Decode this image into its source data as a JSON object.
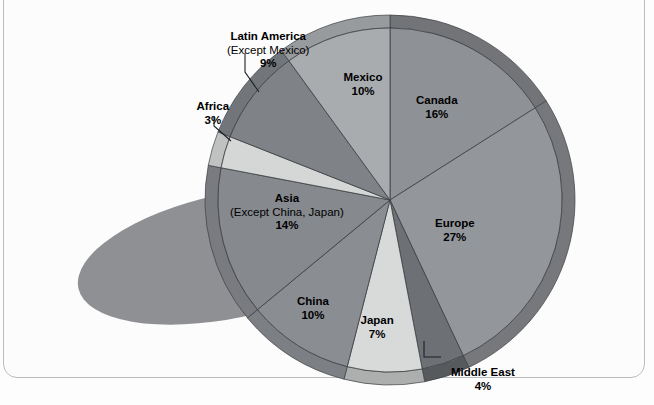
{
  "chart_data": {
    "type": "pie",
    "title": "",
    "categories": [
      "Canada",
      "Europe",
      "Middle East",
      "Japan",
      "China",
      "Asia (Except China, Japan)",
      "Africa",
      "Latin America (Except Mexico)",
      "Mexico"
    ],
    "values": [
      16,
      27,
      4,
      7,
      10,
      14,
      3,
      9,
      10
    ],
    "value_suffix": "%",
    "legend": "none",
    "grid": false,
    "labels_inside": true,
    "slices": [
      {
        "name": "Canada",
        "label": "Canada",
        "sublabel": "",
        "pct": "16%",
        "value": 16,
        "color": "#8e9196",
        "start_deg": 0,
        "end_deg": 57.6,
        "label_x": 437,
        "label_y": 94,
        "leader": false
      },
      {
        "name": "Europe",
        "label": "Europe",
        "sublabel": "",
        "pct": "27%",
        "value": 27,
        "color": "#93969b",
        "start_deg": 57.6,
        "end_deg": 154.8,
        "label_x": 455,
        "label_y": 217,
        "leader": false
      },
      {
        "name": "Middle East",
        "label": "Middle East",
        "sublabel": "",
        "pct": "4%",
        "value": 4,
        "color": "#6d7074",
        "start_deg": 154.8,
        "end_deg": 169.2,
        "label_x": 483,
        "label_y": 366,
        "leader": true
      },
      {
        "name": "Japan",
        "label": "Japan",
        "sublabel": "",
        "pct": "7%",
        "value": 7,
        "color": "#d8dad9",
        "start_deg": 169.2,
        "end_deg": 194.4,
        "label_x": 377,
        "label_y": 314,
        "leader": false
      },
      {
        "name": "China",
        "label": "China",
        "sublabel": "",
        "pct": "10%",
        "value": 10,
        "color": "#8a8d92",
        "start_deg": 194.4,
        "end_deg": 230.4,
        "label_x": 313,
        "label_y": 295,
        "leader": false
      },
      {
        "name": "Asia",
        "label": "Asia",
        "sublabel": "(Except China, Japan)",
        "pct": "14%",
        "value": 14,
        "color": "#86898e",
        "start_deg": 230.4,
        "end_deg": 280.8,
        "label_x": 287,
        "label_y": 192,
        "leader": false
      },
      {
        "name": "Africa",
        "label": "Africa",
        "sublabel": "",
        "pct": "3%",
        "value": 3,
        "color": "#d5d7d6",
        "start_deg": 280.8,
        "end_deg": 291.6,
        "label_x": 213,
        "label_y": 100,
        "leader": true
      },
      {
        "name": "Latin America",
        "label": "Latin America",
        "sublabel": "(Except Mexico)",
        "pct": "9%",
        "value": 9,
        "color": "#7f8287",
        "start_deg": 291.6,
        "end_deg": 324.0,
        "label_x": 268,
        "label_y": 30,
        "leader": true
      },
      {
        "name": "Mexico",
        "label": "Mexico",
        "sublabel": "",
        "pct": "10%",
        "value": 10,
        "color": "#a9acaf",
        "start_deg": 324.0,
        "end_deg": 360.0,
        "label_x": 363,
        "label_y": 71,
        "leader": false
      }
    ],
    "geometry": {
      "cx": 390,
      "cy": 200,
      "r": 172,
      "rim": 13,
      "start_angle_deg": -90
    },
    "colors": {
      "rim_dark": "#6f7276",
      "rim_light": "#bcbfc1",
      "shadow": "#8e9094",
      "outline": "#3c3f42",
      "frame": "#b9bcc0",
      "background": "#fcfcfc",
      "text": "#000000"
    },
    "shadow_ellipse": {
      "cx": 230,
      "cy": 256,
      "rx": 155,
      "ry": 62
    }
  }
}
